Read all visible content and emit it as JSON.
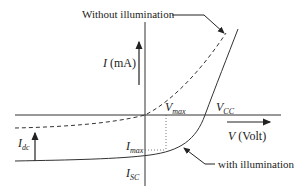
{
  "diagram": {
    "labels": {
      "without_illumination": "Without illumination",
      "with_illumination": "with illumination",
      "y_axis_var": "I",
      "y_axis_unit": " (mA)",
      "x_axis_var": "V",
      "x_axis_unit": " (Volt)",
      "vmax_main": "V",
      "vmax_sub": "max",
      "vcc_main": "V",
      "vcc_sub": "CC",
      "imax_main": "I",
      "imax_sub": "max",
      "isc_main": "I",
      "isc_sub": "SC",
      "idc_main": "I",
      "idc_sub": "dc"
    },
    "colors": {
      "line": "#333333",
      "text": "#222222",
      "background": "#ffffff"
    },
    "curves": [
      {
        "name": "without illumination",
        "style": "dashed"
      },
      {
        "name": "with illumination",
        "style": "solid"
      }
    ]
  }
}
